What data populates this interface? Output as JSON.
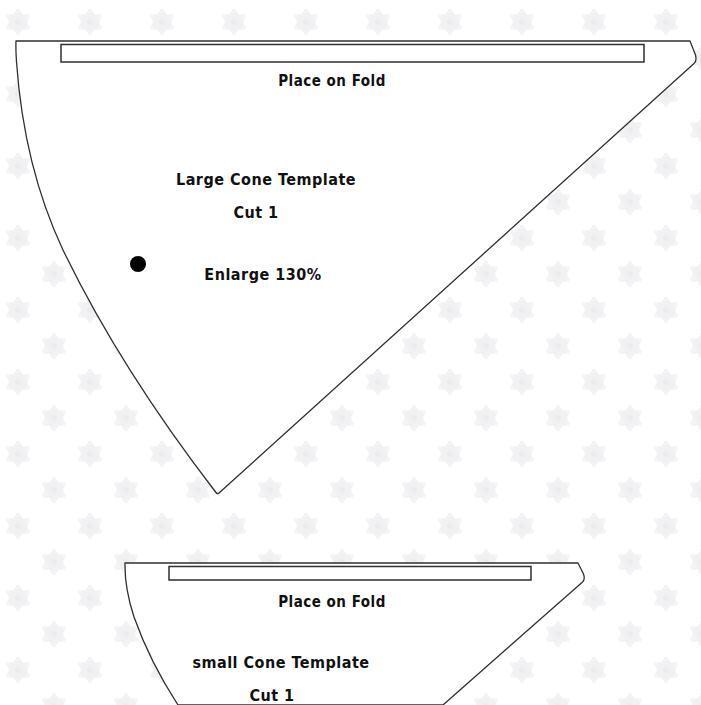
{
  "document": {
    "title": "Cone Templates Printable Pattern Sheet",
    "background_color": "#ffffff",
    "line_color": "#2b2b2b",
    "text_color": "#111111",
    "watermark_color": "#f2f2f4"
  },
  "large_cone": {
    "fold_label": "Place on Fold",
    "name_label": "Large Cone Template",
    "cut_label": "Cut 1",
    "enlarge_label": "Enlarge 130%",
    "dot": {
      "cx": 138,
      "cy": 264,
      "r": 8,
      "color": "#000000"
    },
    "outline_path": "M 16 41 L 690 41 L 695 55 Q 697 61 694 63 L 218 494 Q 216 496 214 493 Q 60 250 17 60 Q 14 48 16 41 Z",
    "fold_rect_path": "M 61 44 L 644 44 L 644 62 L 61 62 Z",
    "top_edge_path": "M 16 41 L 690 41",
    "left_curve_path": "M 16 41 Q 22 200 218 494",
    "right_edge_path": "M 694 63 L 218 494"
  },
  "small_cone": {
    "fold_label": "Place on Fold",
    "name_label": "small Cone Template",
    "cut_label": "Cut 1",
    "outline_path": "M 125 563 L 578 563 L 583 574 Q 585 580 582 582 L 300 705 L 175 705 Q 130 640 126 580 Q 124 568 125 563 Z",
    "fold_rect_path": "M 169 566 L 531 566 L 531 580 L 169 580 Z",
    "top_edge_path": "M 125 563 L 578 563",
    "left_curve_path": "M 125 563 Q 128 640 179 705",
    "right_edge_path": "M 582 582 L 446 705"
  },
  "watermark": {
    "icon_name": "rosette-watermark-icon",
    "spacing_x": 72,
    "spacing_y": 72,
    "rows": 11,
    "cols": 11
  },
  "text_positions": {
    "large_fold": {
      "x": 332,
      "y": 82
    },
    "large_name": {
      "x": 266,
      "y": 181
    },
    "large_cut": {
      "x": 256,
      "y": 214
    },
    "large_enlarge": {
      "x": 263,
      "y": 276
    },
    "small_fold": {
      "x": 332,
      "y": 603
    },
    "small_name": {
      "x": 281,
      "y": 664
    },
    "small_cut": {
      "x": 272,
      "y": 697
    }
  }
}
